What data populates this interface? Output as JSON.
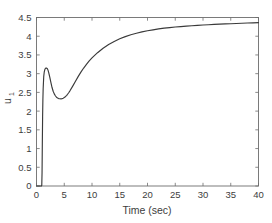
{
  "figure": {
    "background_color": "#ffffff",
    "axis_color": "#6d6d6d",
    "text_color": "#3d3d3d"
  },
  "axes": {
    "xlabel": "Time (sec)",
    "ylabel_base": "u",
    "ylabel_sub": "1",
    "x_ticks": [
      "0",
      "5",
      "10",
      "15",
      "20",
      "25",
      "30",
      "35",
      "40"
    ],
    "y_ticks": [
      "0",
      "0.5",
      "1",
      "1.5",
      "2",
      "2.5",
      "3",
      "3.5",
      "4",
      "4.5"
    ]
  },
  "chart_data": {
    "type": "line",
    "title": "",
    "xlabel": "Time (sec)",
    "ylabel": "u_1",
    "xlim": [
      0,
      40
    ],
    "ylim": [
      0,
      4.5
    ],
    "xticks": [
      0,
      5,
      10,
      15,
      20,
      25,
      30,
      35,
      40
    ],
    "yticks": [
      0,
      0.5,
      1,
      1.5,
      2,
      2.5,
      3,
      3.5,
      4,
      4.5
    ],
    "grid": false,
    "legend": null,
    "line_color": "#3a3a3a",
    "series": [
      {
        "name": "u1",
        "x": [
          0.0,
          0.2,
          0.4,
          0.6,
          0.8,
          0.9,
          0.95,
          1.0,
          1.05,
          1.1,
          1.15,
          1.2,
          1.3,
          1.4,
          1.5,
          1.6,
          1.7,
          1.8,
          1.9,
          2.0,
          2.1,
          2.2,
          2.4,
          2.6,
          2.8,
          3.0,
          3.2,
          3.4,
          3.6,
          3.8,
          4.0,
          4.2,
          4.4,
          4.6,
          4.8,
          5.0,
          5.2,
          5.4,
          5.6,
          5.8,
          6.0,
          6.5,
          7.0,
          7.5,
          8.0,
          8.5,
          9.0,
          9.5,
          10.0,
          11.0,
          12.0,
          13.0,
          14.0,
          15.0,
          16.0,
          17.0,
          18.0,
          19.0,
          20.0,
          21.0,
          22.0,
          23.0,
          24.0,
          25.0,
          26.0,
          27.0,
          28.0,
          29.0,
          30.0,
          31.0,
          32.0,
          33.0,
          34.0,
          35.0,
          36.0,
          37.0,
          38.0,
          39.0,
          40.0
        ],
        "y": [
          0.0,
          0.0,
          0.0,
          0.0,
          0.0,
          0.0,
          0.02,
          0.35,
          1.15,
          1.85,
          2.3,
          2.6,
          2.92,
          3.05,
          3.11,
          3.14,
          3.15,
          3.15,
          3.14,
          3.12,
          3.08,
          3.03,
          2.9,
          2.76,
          2.63,
          2.53,
          2.46,
          2.41,
          2.37,
          2.35,
          2.335,
          2.33,
          2.328,
          2.333,
          2.345,
          2.362,
          2.385,
          2.415,
          2.45,
          2.49,
          2.535,
          2.66,
          2.79,
          2.92,
          3.04,
          3.15,
          3.25,
          3.34,
          3.42,
          3.56,
          3.68,
          3.78,
          3.86,
          3.93,
          3.99,
          4.04,
          4.08,
          4.115,
          4.145,
          4.17,
          4.195,
          4.215,
          4.23,
          4.245,
          4.258,
          4.27,
          4.28,
          4.29,
          4.3,
          4.307,
          4.315,
          4.322,
          4.328,
          4.334,
          4.34,
          4.346,
          4.352,
          4.357,
          4.362
        ]
      }
    ]
  }
}
